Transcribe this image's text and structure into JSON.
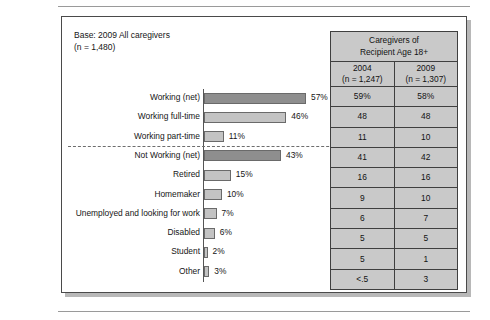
{
  "base_note": "Base: 2009 All caregivers\n(n = 1,480)",
  "chart_data": {
    "type": "bar",
    "title": "",
    "xlabel": "",
    "ylabel": "",
    "orientation": "horizontal",
    "xlim": [
      0,
      60
    ],
    "grid": false,
    "legend": "none",
    "categories": [
      "Working (net)",
      "Working full-time",
      "Working part-time",
      "Not Working (net)",
      "Retired",
      "Homemaker",
      "Unemployed and looking for work",
      "Disabled",
      "Student",
      "Other"
    ],
    "values": [
      57,
      46,
      11,
      43,
      15,
      10,
      7,
      6,
      2,
      3
    ],
    "value_labels": [
      "57%",
      "46%",
      "11%",
      "43%",
      "15%",
      "10%",
      "7%",
      "6%",
      "2%",
      "3%"
    ],
    "kinds": [
      "net",
      "sub",
      "sub",
      "net",
      "sub",
      "sub",
      "sub",
      "sub",
      "sub",
      "sub"
    ],
    "separator_after_index": 2,
    "colors": {
      "net_bar": "#8e8e8e",
      "sub_bar": "#c3c3c3",
      "bar_border": "#6a6a6a",
      "table_fill": "#c9c9c9",
      "table_border": "#3f3f3f",
      "panel_border": "#4a4a4a",
      "text": "#161616"
    }
  },
  "table": {
    "title": "Caregivers of\nRecipient Age 18+",
    "columns": [
      {
        "year": "2004",
        "n": "(n = 1,247)"
      },
      {
        "year": "2009",
        "n": "(n = 1,307)"
      }
    ],
    "rows": [
      {
        "col_2004": "59%",
        "col_2009": "58%"
      },
      {
        "col_2004": "48",
        "col_2009": "48"
      },
      {
        "col_2004": "11",
        "col_2009": "10"
      },
      {
        "col_2004": "41",
        "col_2009": "42"
      },
      {
        "col_2004": "16",
        "col_2009": "16"
      },
      {
        "col_2004": "9",
        "col_2009": "10"
      },
      {
        "col_2004": "6",
        "col_2009": "7"
      },
      {
        "col_2004": "5",
        "col_2009": "5"
      },
      {
        "col_2004": "5",
        "col_2009": "1"
      },
      {
        "col_2004": "<.5",
        "col_2009": "3"
      }
    ]
  }
}
